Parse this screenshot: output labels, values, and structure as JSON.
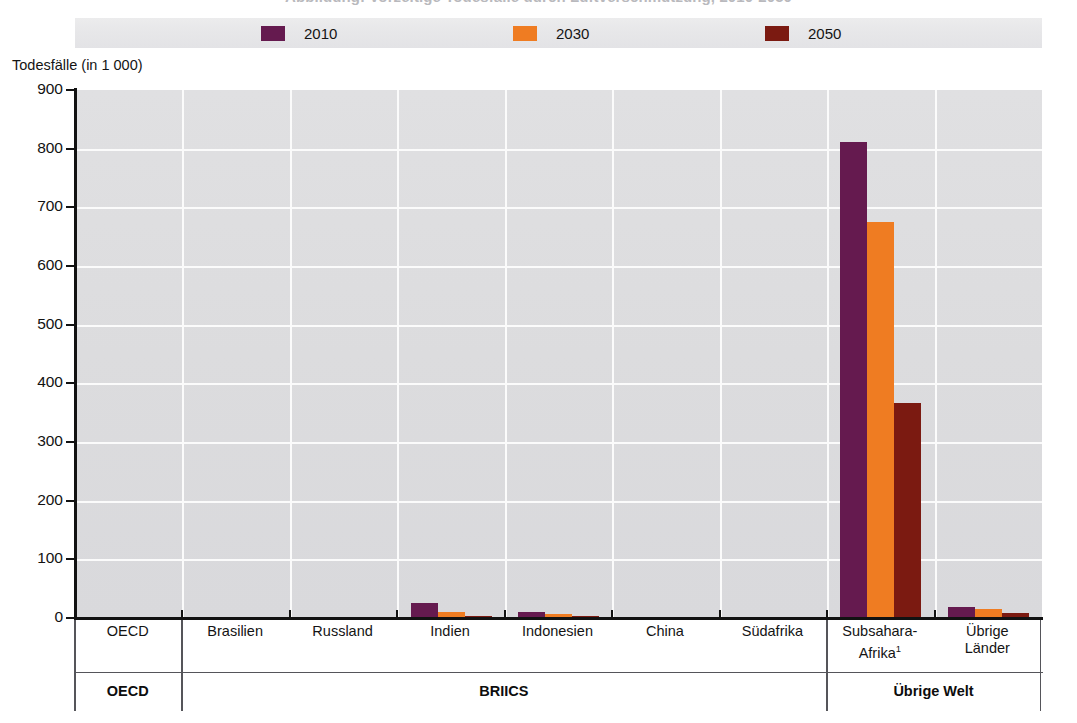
{
  "title_remnant": "Abbildung: Vorzeitige Todesfälle durch Luftverschmutzung, 2010-2050",
  "y_axis": {
    "title": "Todesfälle (in 1 000)",
    "ticks": [
      "900",
      "800",
      "700",
      "600",
      "500",
      "400",
      "300",
      "200",
      "100",
      "0"
    ]
  },
  "legend": {
    "items": [
      {
        "label": "2010",
        "color": "#651a4f"
      },
      {
        "label": "2030",
        "color": "#ef7c22"
      },
      {
        "label": "2050",
        "color": "#7b1a11"
      }
    ]
  },
  "groups": [
    {
      "label": "OECD",
      "categories": [
        "OECD"
      ]
    },
    {
      "label": "BRIICS",
      "categories": [
        "Brasilien",
        "Russland",
        "Indien",
        "Indonesien",
        "China",
        "Südafrika"
      ]
    },
    {
      "label": "Übrige Welt",
      "categories": [
        "Subsahara-Afrika¹",
        "Übrige Länder"
      ]
    }
  ],
  "chart_data": {
    "type": "bar",
    "title": "",
    "xlabel": "",
    "ylabel": "Todesfälle (in 1 000)",
    "ylim": [
      0,
      900
    ],
    "yticks": [
      0,
      100,
      200,
      300,
      400,
      500,
      600,
      700,
      800,
      900
    ],
    "grid": true,
    "legend_position": "top",
    "categories": [
      "OECD",
      "Brasilien",
      "Russland",
      "Indien",
      "Indonesien",
      "China",
      "Südafrika",
      "Subsahara-Afrika¹",
      "Übrige Länder"
    ],
    "category_groups": [
      "OECD",
      "BRIICS",
      "BRIICS",
      "BRIICS",
      "BRIICS",
      "BRIICS",
      "BRIICS",
      "Übrige Welt",
      "Übrige Welt"
    ],
    "series": [
      {
        "name": "2010",
        "color": "#651a4f",
        "values": [
          0,
          0,
          0,
          25,
          10,
          0,
          0,
          812,
          19
        ]
      },
      {
        "name": "2030",
        "color": "#ef7c22",
        "values": [
          0,
          0,
          0,
          10,
          7,
          0,
          0,
          675,
          15
        ]
      },
      {
        "name": "2050",
        "color": "#7b1a11",
        "values": [
          0,
          0,
          0,
          4,
          4,
          0,
          0,
          366,
          9
        ]
      }
    ]
  }
}
